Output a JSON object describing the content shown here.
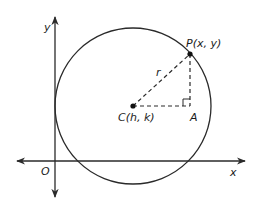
{
  "diagram": {
    "colors": {
      "stroke": "#2a2a2a",
      "background": "#ffffff"
    },
    "axes": {
      "x_label": "x",
      "y_label": "y",
      "origin_label": "O"
    },
    "circle": {
      "center_label": "C(h, k)",
      "radius_label": "r"
    },
    "points": {
      "P_label": "P(x, y)",
      "A_label": "A"
    }
  }
}
